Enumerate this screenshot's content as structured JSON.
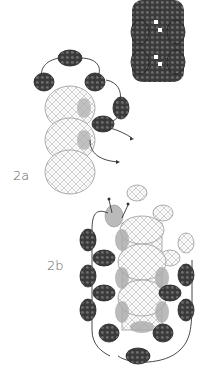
{
  "figure": {
    "labels": {
      "step_a": "2a",
      "step_b": "2b"
    },
    "colors": {
      "dark_bead": "#3a3a3a",
      "dark_bead_highlight": "#6a6a6a",
      "light_bead_stroke": "#9a9a9a",
      "thread": "#333333",
      "gray_bead": "#a8a8a8"
    }
  }
}
